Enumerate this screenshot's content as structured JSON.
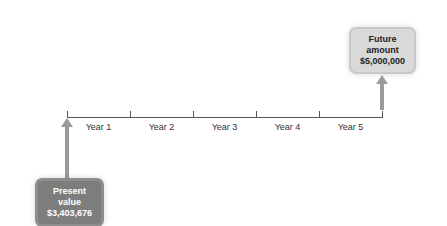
{
  "timeline": {
    "years": [
      "Year 1",
      "Year 2",
      "Year 3",
      "Year 4",
      "Year 5"
    ]
  },
  "future": {
    "line1": "Future",
    "line2": "amount",
    "line3": "$5,000,000"
  },
  "present": {
    "line1": "Present",
    "line2": "value",
    "line3": "$3,403,676"
  },
  "colors": {
    "future_box": "#d9d9d9",
    "present_box": "#7d7d7d",
    "arrow": "#9a9a9a",
    "line": "#555555"
  }
}
